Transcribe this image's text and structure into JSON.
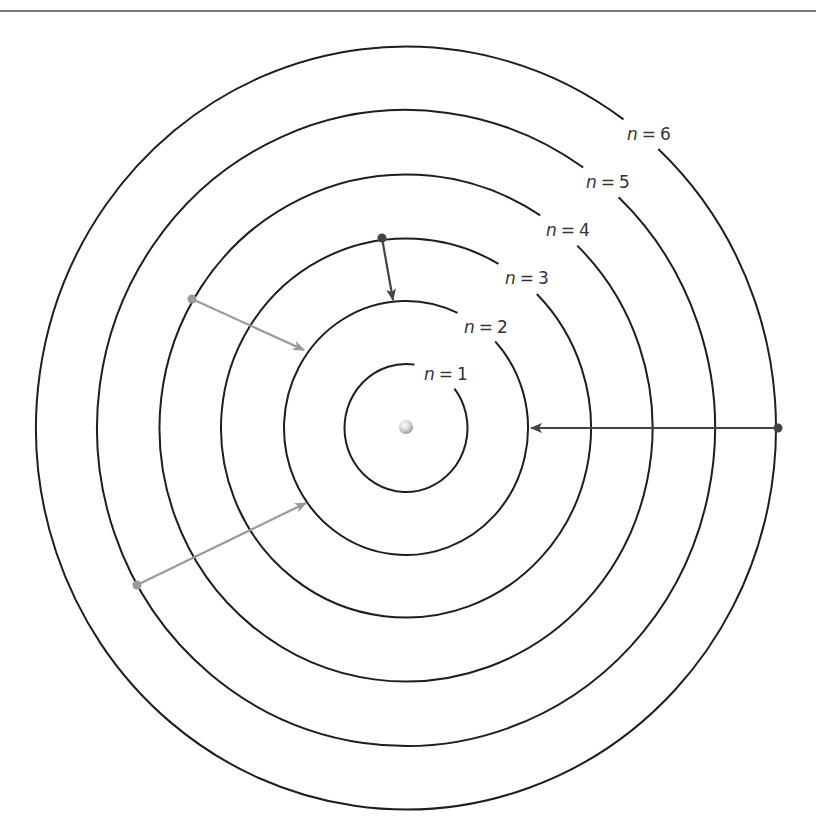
{
  "figure": {
    "title": "",
    "center": {
      "x": 406,
      "y": 428
    },
    "colors": {
      "orbit": "#1e1e1e",
      "transition_dark": "#444444",
      "transition_light": "#9a9a9a",
      "label": "#333333",
      "rule": "#7a7a7a"
    },
    "nucleus": {
      "label": "nucleus",
      "x": 406,
      "y": 427,
      "r": 7
    },
    "orbits": [
      {
        "n": 1,
        "label": "n = 1",
        "var": "n",
        "eq": "=",
        "num": "1",
        "rx": 61.5,
        "ry": 64,
        "gap_start": -82,
        "gap_end": -38,
        "label_x": 446,
        "label_y": 374
      },
      {
        "n": 2,
        "label": "n = 2",
        "var": "n",
        "eq": "=",
        "num": "2",
        "rx": 122,
        "ry": 127,
        "gap_start": -65,
        "gap_end": -43,
        "label_x": 486,
        "label_y": 327
      },
      {
        "n": 3,
        "label": "n = 3",
        "var": "n",
        "eq": "=",
        "num": "3",
        "rx": 185,
        "ry": 189.5,
        "gap_start": -60,
        "gap_end": -45,
        "label_x": 527,
        "label_y": 278
      },
      {
        "n": 4,
        "label": "n = 4",
        "var": "n",
        "eq": "=",
        "num": "4",
        "rx": 246.5,
        "ry": 253.5,
        "gap_start": -57,
        "gap_end": -46,
        "label_x": 568,
        "label_y": 230
      },
      {
        "n": 5,
        "label": "n = 5",
        "var": "n",
        "eq": "=",
        "num": "5",
        "rx": 309,
        "ry": 318,
        "gap_start": -55,
        "gap_end": -46.5,
        "label_x": 608,
        "label_y": 182
      },
      {
        "n": 6,
        "label": "n = 6",
        "var": "n",
        "eq": "=",
        "num": "6",
        "rx": 370,
        "ry": 381.5,
        "gap_start": -54,
        "gap_end": -47,
        "label_x": 649,
        "label_y": 134
      }
    ],
    "transitions": [
      {
        "from": 6,
        "to": 2,
        "tone": "dark",
        "x1": 778,
        "y1": 428,
        "x2": 531,
        "y2": 428
      },
      {
        "from": 3,
        "to": 2,
        "tone": "dark",
        "x1": 382,
        "y1": 238,
        "x2": 393,
        "y2": 300
      },
      {
        "from": 4,
        "to": 2,
        "tone": "light",
        "x1": 192,
        "y1": 299,
        "x2": 304,
        "y2": 350
      },
      {
        "from": 5,
        "to": 2,
        "tone": "light",
        "x1": 137,
        "y1": 585,
        "x2": 306,
        "y2": 503
      }
    ]
  }
}
